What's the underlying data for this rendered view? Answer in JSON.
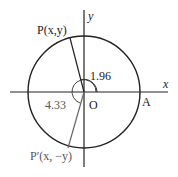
{
  "diagram": {
    "type": "unit-circle",
    "axes": {
      "x_label": "x",
      "y_label": "y"
    },
    "origin_label": "O",
    "point_A_label": "A",
    "point_P_label": "P(x,y)",
    "point_P_prime_label": "P′(x, −y)",
    "angle_1": "1.96",
    "angle_2": "4.33"
  }
}
